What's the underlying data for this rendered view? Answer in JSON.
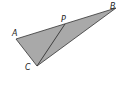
{
  "diagram": {
    "type": "geometry-triangle",
    "fill_color": "#a9a9a9",
    "stroke_color": "#333333",
    "points": {
      "A": {
        "x": 16,
        "y": 39,
        "label": "A",
        "lx": 12,
        "ly": 36
      },
      "B": {
        "x": 116,
        "y": 8,
        "label": "B",
        "lx": 110,
        "ly": 9
      },
      "C": {
        "x": 37,
        "y": 66,
        "label": "C",
        "lx": 25,
        "ly": 70
      },
      "P": {
        "x": 65,
        "y": 24,
        "label": "P",
        "lx": 61,
        "ly": 22
      }
    },
    "segments": [
      [
        "A",
        "B"
      ],
      [
        "B",
        "C"
      ],
      [
        "C",
        "A"
      ],
      [
        "C",
        "P"
      ]
    ]
  }
}
